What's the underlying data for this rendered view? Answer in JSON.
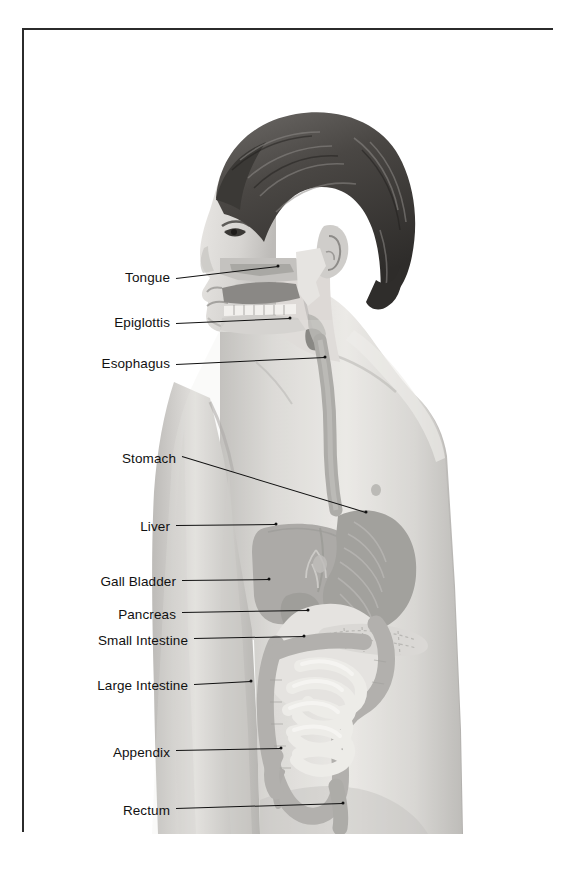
{
  "figure": {
    "frame_color": "#2b2b2b",
    "background_color": "#ffffff",
    "label_color": "#111111",
    "leader_color": "#111111"
  },
  "labels": [
    {
      "id": "tongue",
      "text": "Tongue",
      "text_right": 170,
      "y": 278,
      "line_x1": 176,
      "line_y1": 278,
      "line_x2": 278,
      "line_y2": 266
    },
    {
      "id": "epiglottis",
      "text": "Epiglottis",
      "text_right": 170,
      "y": 323,
      "line_x1": 176,
      "line_y1": 323,
      "line_x2": 290,
      "line_y2": 318
    },
    {
      "id": "esophagus",
      "text": "Esophagus",
      "text_right": 170,
      "y": 364,
      "line_x1": 176,
      "line_y1": 364,
      "line_x2": 325,
      "line_y2": 357
    },
    {
      "id": "stomach",
      "text": "Stomach",
      "text_right": 176,
      "y": 459,
      "line_x1": 182,
      "line_y1": 456,
      "line_x2": 366,
      "line_y2": 512
    },
    {
      "id": "liver",
      "text": "Liver",
      "text_right": 170,
      "y": 527,
      "line_x1": 176,
      "line_y1": 525,
      "line_x2": 276,
      "line_y2": 524
    },
    {
      "id": "gall-bladder",
      "text": "Gall Bladder",
      "text_right": 176,
      "y": 582,
      "line_x1": 182,
      "line_y1": 580,
      "line_x2": 269,
      "line_y2": 579
    },
    {
      "id": "pancreas",
      "text": "Pancreas",
      "text_right": 176,
      "y": 615,
      "line_x1": 182,
      "line_y1": 612,
      "line_x2": 308,
      "line_y2": 610
    },
    {
      "id": "small-intestine",
      "text": "Small Intestine",
      "text_right": 188,
      "y": 641,
      "line_x1": 194,
      "line_y1": 638,
      "line_x2": 304,
      "line_y2": 636
    },
    {
      "id": "large-intestine",
      "text": "Large Intestine",
      "text_right": 188,
      "y": 686,
      "line_x1": 194,
      "line_y1": 684,
      "line_x2": 251,
      "line_y2": 681
    },
    {
      "id": "appendix",
      "text": "Appendix",
      "text_right": 170,
      "y": 753,
      "line_x1": 176,
      "line_y1": 750,
      "line_x2": 281,
      "line_y2": 748
    },
    {
      "id": "rectum",
      "text": "Rectum",
      "text_right": 170,
      "y": 811,
      "line_x1": 176,
      "line_y1": 808,
      "line_x2": 343,
      "line_y2": 803
    }
  ]
}
